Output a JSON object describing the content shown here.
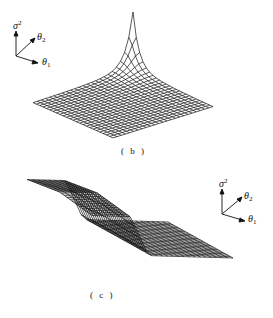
{
  "figure": {
    "panels": [
      {
        "id": "b",
        "caption": "( b )",
        "description": "3D mesh surface with a sharp spike near the back corner rising from a flat sheet",
        "axes": {
          "vertical": {
            "symbol": "σ",
            "superscript": "2",
            "subscript": "r"
          },
          "axis2": {
            "symbol": "θ",
            "subscript": "2"
          },
          "axis1": {
            "symbol": "θ",
            "subscript": "1"
          }
        }
      },
      {
        "id": "c",
        "caption": "( c )",
        "description": "3D mesh surface with a tall ridge wall along the left edge and a flat sheet elsewhere",
        "axes": {
          "vertical": {
            "symbol": "σ",
            "superscript": "2",
            "subscript": "r"
          },
          "axis2": {
            "symbol": "θ",
            "subscript": "2"
          },
          "axis1": {
            "symbol": "θ",
            "subscript": "1"
          }
        }
      }
    ]
  }
}
